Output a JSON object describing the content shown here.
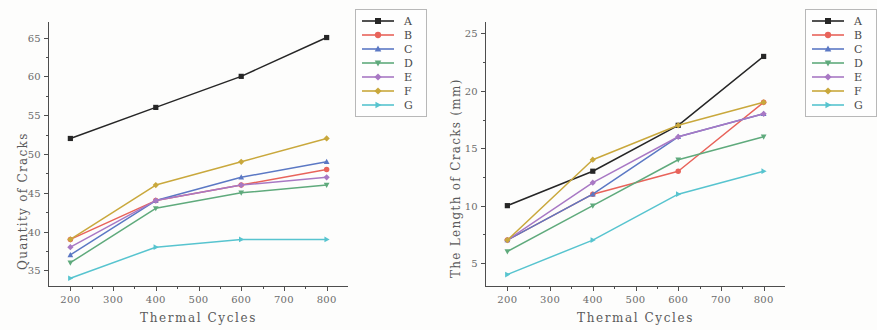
{
  "figure": {
    "background": "#fdfdfc",
    "panels": [
      "left",
      "right"
    ]
  },
  "chart_data": [
    {
      "type": "line",
      "panel": "left",
      "title": "",
      "xlabel": "Thermal Cycles",
      "ylabel": "Quantity of Cracks",
      "x": [
        200,
        400,
        600,
        800
      ],
      "xlim": [
        150,
        850
      ],
      "ylim": [
        33,
        67
      ],
      "xticks": [
        200,
        300,
        400,
        500,
        600,
        700,
        800
      ],
      "yticks": [
        35,
        40,
        45,
        50,
        55,
        60,
        65
      ],
      "grid": false,
      "legend_position": "upper right outside",
      "series": [
        {
          "name": "A",
          "color": "#262626",
          "marker": "square",
          "values": [
            52,
            56,
            60,
            65
          ]
        },
        {
          "name": "B",
          "color": "#e8635a",
          "marker": "circle",
          "values": [
            39,
            44,
            46,
            48
          ]
        },
        {
          "name": "C",
          "color": "#5b78c4",
          "marker": "triangle-up",
          "values": [
            37,
            44,
            47,
            49
          ]
        },
        {
          "name": "D",
          "color": "#5faa7c",
          "marker": "triangle-down",
          "values": [
            36,
            43,
            45,
            46
          ]
        },
        {
          "name": "E",
          "color": "#a878c4",
          "marker": "diamond",
          "values": [
            38,
            44,
            46,
            47
          ]
        },
        {
          "name": "F",
          "color": "#c9a83c",
          "marker": "diamond-left",
          "values": [
            39,
            46,
            49,
            52
          ]
        },
        {
          "name": "G",
          "color": "#57c4cf",
          "marker": "triangle-right",
          "values": [
            34,
            38,
            39,
            39
          ]
        }
      ]
    },
    {
      "type": "line",
      "panel": "right",
      "title": "",
      "xlabel": "Thermal Cycles",
      "ylabel": "The Length of Cracks (mm)",
      "ylabel_unit": "(mm)",
      "x": [
        200,
        400,
        600,
        800
      ],
      "xlim": [
        150,
        850
      ],
      "ylim": [
        3,
        26
      ],
      "xticks": [
        200,
        300,
        400,
        500,
        600,
        700,
        800
      ],
      "yticks": [
        5,
        10,
        15,
        20,
        25
      ],
      "grid": false,
      "legend_position": "upper right outside",
      "series": [
        {
          "name": "A",
          "color": "#262626",
          "marker": "square",
          "values": [
            10,
            13,
            17,
            23
          ]
        },
        {
          "name": "B",
          "color": "#e8635a",
          "marker": "circle",
          "values": [
            7,
            11,
            13,
            19
          ]
        },
        {
          "name": "C",
          "color": "#5b78c4",
          "marker": "triangle-up",
          "values": [
            7,
            11,
            16,
            18
          ]
        },
        {
          "name": "D",
          "color": "#5faa7c",
          "marker": "triangle-down",
          "values": [
            6,
            10,
            14,
            16
          ]
        },
        {
          "name": "E",
          "color": "#a878c4",
          "marker": "diamond",
          "values": [
            7,
            12,
            16,
            18
          ]
        },
        {
          "name": "F",
          "color": "#c9a83c",
          "marker": "diamond-left",
          "values": [
            7,
            14,
            17,
            19
          ]
        },
        {
          "name": "G",
          "color": "#57c4cf",
          "marker": "triangle-right",
          "values": [
            4,
            7,
            11,
            13
          ]
        }
      ]
    }
  ]
}
